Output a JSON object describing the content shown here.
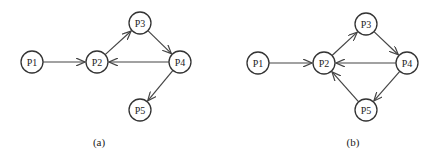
{
  "diagrams": [
    {
      "id": "a",
      "caption": "(a)",
      "caption_pos": [
        99,
        146
      ],
      "nodes": [
        {
          "id": "P1",
          "label": "P1",
          "x": 32,
          "y": 62
        },
        {
          "id": "P2",
          "label": "P2",
          "x": 97,
          "y": 62
        },
        {
          "id": "P3",
          "label": "P3",
          "x": 140,
          "y": 23
        },
        {
          "id": "P4",
          "label": "P4",
          "x": 180,
          "y": 62
        },
        {
          "id": "P5",
          "label": "P5",
          "x": 140,
          "y": 110
        }
      ],
      "edges": [
        {
          "from": "P1",
          "to": "P2"
        },
        {
          "from": "P2",
          "to": "P3"
        },
        {
          "from": "P3",
          "to": "P4"
        },
        {
          "from": "P4",
          "to": "P2"
        },
        {
          "from": "P4",
          "to": "P5"
        }
      ]
    },
    {
      "id": "b",
      "caption": "(b)",
      "caption_pos": [
        353,
        146
      ],
      "nodes": [
        {
          "id": "P1",
          "label": "P1",
          "x": 258,
          "y": 63
        },
        {
          "id": "P2",
          "label": "P2",
          "x": 324,
          "y": 63
        },
        {
          "id": "P3",
          "label": "P3",
          "x": 366,
          "y": 24
        },
        {
          "id": "P4",
          "label": "P4",
          "x": 407,
          "y": 63
        },
        {
          "id": "P5",
          "label": "P5",
          "x": 366,
          "y": 110
        }
      ],
      "edges": [
        {
          "from": "P1",
          "to": "P2"
        },
        {
          "from": "P2",
          "to": "P3"
        },
        {
          "from": "P3",
          "to": "P4"
        },
        {
          "from": "P4",
          "to": "P2"
        },
        {
          "from": "P4",
          "to": "P5"
        },
        {
          "from": "P5",
          "to": "P2"
        }
      ]
    }
  ],
  "style": {
    "node_radius": 11,
    "stroke_color": "#333333"
  }
}
